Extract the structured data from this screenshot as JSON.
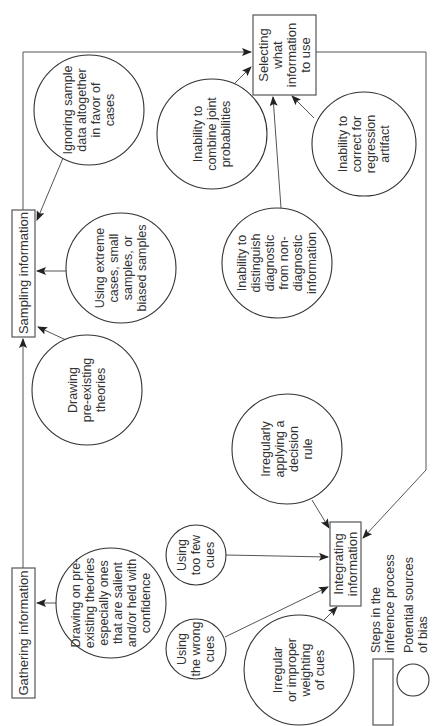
{
  "steps": {
    "gathering": "Gathering information",
    "sampling": "Sampling information",
    "selecting": [
      "Selecting",
      "what",
      "information",
      "to use"
    ],
    "integrating": [
      "Integrating",
      "information"
    ]
  },
  "biases": {
    "ignoring_sample": [
      "Ignoring sample",
      "data altogether",
      "in favor of",
      "cases"
    ],
    "using_extreme": [
      "Using extreme",
      "cases, small",
      "samples, or",
      "biased samples"
    ],
    "drawing_theories": [
      "Drawing",
      "pre-existing",
      "theories"
    ],
    "drawing_salient": [
      "Drawing on pre-",
      "existing theories",
      "especially ones",
      "that are salient",
      "and/or held with",
      "confidence"
    ],
    "combine_joint": [
      "Inability to",
      "combine joint",
      "probabilities"
    ],
    "distinguish_diagnostic": [
      "Inability to",
      "distinguish",
      "diagnostic",
      "from non-",
      "diagnostic",
      "information"
    ],
    "regression_artifact": [
      "Inability to",
      "correct for",
      "regression",
      "artifact"
    ],
    "decision_rule": [
      "Irregularly",
      "applying a",
      "decision",
      "rule"
    ],
    "too_few_cues": [
      "Using",
      "too few",
      "cues"
    ],
    "wrong_cues": [
      "Using",
      "the wrong",
      "cues"
    ],
    "improper_weighting": [
      "Irregular",
      "or improper",
      "weighting",
      "of cues"
    ]
  },
  "legend": {
    "steps": [
      "Steps in the",
      "inference process"
    ],
    "sources": [
      "Potential sources",
      "of bias"
    ]
  }
}
